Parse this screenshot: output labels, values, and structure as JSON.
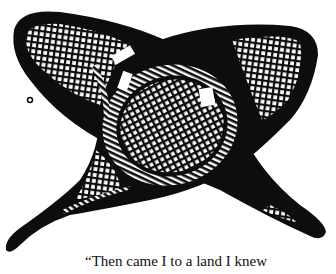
{
  "figure": {
    "ink_color": "#0d0d0d",
    "paper_color": "#ffffff",
    "icons": [
      "snowshoe-left-icon",
      "snowshoe-right-icon"
    ]
  },
  "caption": {
    "text": "“Then came I to a land I knew"
  }
}
